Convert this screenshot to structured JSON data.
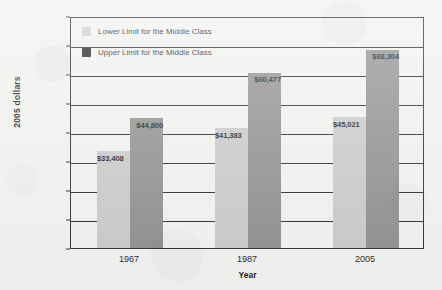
{
  "chart_data": {
    "type": "bar",
    "title": "",
    "xlabel": "Year",
    "ylabel": "2005 dollars",
    "categories": [
      "1967",
      "1987",
      "2005"
    ],
    "ylim": [
      0,
      80000
    ],
    "ytick_labels": [
      "$80,000",
      "$70,000",
      "$60,000",
      "$50,000",
      "$40,000",
      "$30,000",
      "$20,000",
      "$10,000",
      "$0"
    ],
    "ytick_values": [
      80000,
      70000,
      60000,
      50000,
      40000,
      30000,
      20000,
      10000,
      0
    ],
    "grid": "horizontal",
    "legend_position": "inside-top-left",
    "series": [
      {
        "name": "Lower Limit for the Middle Class",
        "color": "#c9c9c9",
        "values": [
          33408,
          41383,
          45021
        ],
        "labels": [
          "$33,408",
          "$41,383",
          "$45,021"
        ]
      },
      {
        "name": "Upper Limit for the Middle Class",
        "color": "#8e8e8e",
        "legend_color": "#1d1d1d",
        "values": [
          44800,
          60477,
          68304
        ],
        "labels": [
          "$44,800",
          "$60,477",
          "$68,304"
        ]
      }
    ]
  }
}
